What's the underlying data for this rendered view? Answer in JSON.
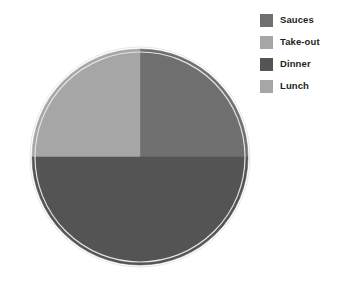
{
  "chart_data": {
    "type": "pie",
    "title": "",
    "subtitle": "",
    "xlabel": "",
    "ylabel": "",
    "grid": false,
    "legend_position": "top-right",
    "categories": [
      "Sauces",
      "Take-out",
      "Dinner",
      "Lunch"
    ],
    "values": [
      25,
      25,
      50,
      0
    ],
    "unit": "%",
    "slices": [
      {
        "label": "Sauces",
        "value": 25,
        "start_angle": 0,
        "end_angle": 90,
        "color": "#6f6f6f"
      },
      {
        "label": "Take-out",
        "value": 25,
        "start_angle": 270,
        "end_angle": 360,
        "color": "#a6a6a6"
      },
      {
        "label": "Dinner",
        "value": 50,
        "start_angle": 90,
        "end_angle": 270,
        "color": "#545454"
      },
      {
        "label": "Lunch",
        "value": 0,
        "start_angle": 360,
        "end_angle": 360,
        "color": "#a6a6a6"
      }
    ],
    "data_labels": [],
    "annotations": []
  },
  "pie": {
    "center_x": 114,
    "center_y": 123,
    "radius": 108,
    "ring_color": "#f2f2f2",
    "ring_width": 5,
    "outline_color": "#d9d9d9"
  },
  "legend": {
    "items": [
      {
        "label": "Sauces",
        "color": "#6f6f6f"
      },
      {
        "label": "Take-out",
        "color": "#a6a6a6"
      },
      {
        "label": "Dinner",
        "color": "#545454"
      },
      {
        "label": "Lunch",
        "color": "#a6a6a6"
      }
    ]
  },
  "colors": {
    "background": "#ffffff",
    "text": "#231f20",
    "sauces": "#6f6f6f",
    "take_out": "#a6a6a6",
    "dinner": "#545454",
    "lunch": "#a6a6a6"
  }
}
